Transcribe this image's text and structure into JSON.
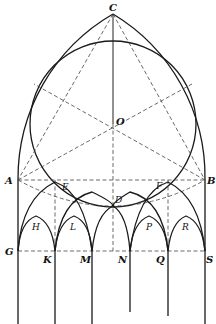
{
  "figure": {
    "points": {
      "C": {
        "label": "C",
        "x": 113,
        "y": 14
      },
      "O": {
        "label": "O",
        "x": 113,
        "y": 124
      },
      "A": {
        "label": "A",
        "x": 18,
        "y": 180
      },
      "B": {
        "label": "B",
        "x": 205,
        "y": 180
      },
      "E": {
        "label": "E",
        "x": 55,
        "y": 180
      },
      "F": {
        "label": "F",
        "x": 168,
        "y": 180
      },
      "D": {
        "label": "D",
        "x": 113,
        "y": 206
      },
      "G": {
        "label": "G",
        "x": 18,
        "y": 251
      },
      "K": {
        "label": "K",
        "x": 55,
        "y": 251
      },
      "M": {
        "label": "M",
        "x": 92,
        "y": 251
      },
      "N": {
        "label": "N",
        "x": 130,
        "y": 251
      },
      "Q": {
        "label": "Q",
        "x": 168,
        "y": 251
      },
      "S": {
        "label": "S",
        "x": 205,
        "y": 251
      },
      "H": {
        "label": "H",
        "x": 36,
        "y": 226
      },
      "L": {
        "label": "L",
        "x": 74,
        "y": 226
      },
      "P": {
        "label": "P",
        "x": 149,
        "y": 226
      },
      "R": {
        "label": "R",
        "x": 186,
        "y": 226
      }
    },
    "labels": {
      "C": "C",
      "O": "O",
      "A": "A",
      "B": "B",
      "E": "E",
      "F": "F",
      "D": "D",
      "G": "G",
      "K": "K",
      "M": "M",
      "N": "N",
      "Q": "Q",
      "S": "S",
      "H": "H",
      "L": "L",
      "P": "P",
      "R": "R"
    },
    "inscribed_circle": {
      "cx": 113,
      "cy": 124,
      "r": 83
    },
    "stroke_color": "#1a1a1a",
    "background": "#ffffff"
  }
}
